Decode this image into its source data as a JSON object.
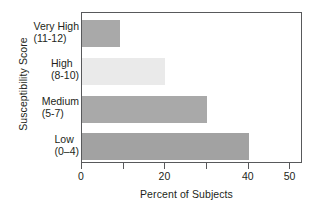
{
  "chart_data": {
    "type": "bar",
    "orientation": "horizontal",
    "title": "",
    "xlabel": "Percent of Subjects",
    "ylabel": "Susceptibility Score",
    "categories": [
      "Very High (11-12)",
      "High (8-10)",
      "Medium (5-7)",
      "Low (0–4)"
    ],
    "category_parts": [
      {
        "name": "Very High",
        "range": "(11-12)"
      },
      {
        "name": "High",
        "range": "(8-10)"
      },
      {
        "name": "Medium",
        "range": "(5-7)"
      },
      {
        "name": "Low",
        "range": "(0–4)"
      }
    ],
    "values": [
      9,
      20,
      30,
      40
    ],
    "bar_colors": [
      "#a9a9a9",
      "#eaeaea",
      "#a9a9a9",
      "#a2a2a2"
    ],
    "xlim": [
      0,
      53
    ],
    "xticks": [
      0,
      10,
      20,
      30,
      40,
      50
    ],
    "xtick_labels": [
      "0",
      "",
      "20",
      "",
      "40",
      "50"
    ],
    "grid": false,
    "legend": "none",
    "frame": true,
    "axis_color": "#58595b"
  }
}
